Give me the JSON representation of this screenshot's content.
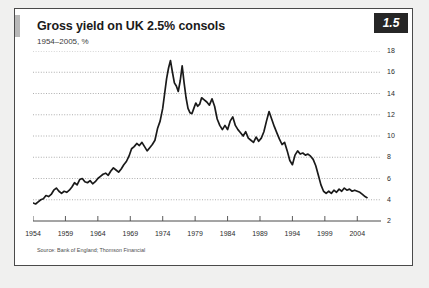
{
  "figure": {
    "badge": "1.5",
    "title": "Gross yield on UK 2.5% consols",
    "subtitle": "1954–2005, %",
    "source": "Source: Bank of England; Thomson Financial"
  },
  "colors": {
    "line": "#1a1a1a",
    "grid": "#9a9a9a",
    "axis": "#4a4a4a",
    "panel_bg": "#ffffff",
    "page_bg": "#f0f0ef",
    "badge_bg": "#262626"
  },
  "chart_data": {
    "type": "line",
    "title": "Gross yield on UK 2.5% consols",
    "subtitle": "1954–2005, %",
    "xlabel": "",
    "ylabel": "%",
    "xlim": [
      1954,
      2005.5
    ],
    "ylim": [
      2,
      18
    ],
    "ytick_step": 2,
    "yticks": [
      2,
      4,
      6,
      8,
      10,
      12,
      14,
      16,
      18
    ],
    "ytick_labels": [
      "2",
      "4",
      "6",
      "8",
      "10",
      "12",
      "14",
      "16",
      "18"
    ],
    "xticks": [
      1954,
      1959,
      1964,
      1969,
      1974,
      1979,
      1984,
      1989,
      1994,
      1999,
      2004
    ],
    "xtick_labels": [
      "1954",
      "1959",
      "1964",
      "1969",
      "1974",
      "1979",
      "1984",
      "1989",
      "1994",
      "1999",
      "2004"
    ],
    "grid": "horizontal-dotted",
    "legend": "none",
    "axis_position": {
      "y": "right",
      "x": "bottom"
    },
    "series": [
      {
        "name": "Gross yield on UK 2.5% consols",
        "x": [
          1954.0,
          1954.4,
          1954.8,
          1955.2,
          1955.6,
          1956.0,
          1956.4,
          1956.8,
          1957.2,
          1957.6,
          1958.0,
          1958.4,
          1958.8,
          1959.2,
          1959.6,
          1960.0,
          1960.4,
          1960.8,
          1961.2,
          1961.6,
          1962.0,
          1962.4,
          1962.8,
          1963.2,
          1963.6,
          1964.0,
          1964.4,
          1964.8,
          1965.2,
          1965.6,
          1966.0,
          1966.4,
          1966.8,
          1967.2,
          1967.6,
          1968.0,
          1968.4,
          1968.8,
          1969.2,
          1969.6,
          1970.0,
          1970.4,
          1970.8,
          1971.2,
          1971.6,
          1972.0,
          1972.4,
          1972.8,
          1973.2,
          1973.6,
          1974.0,
          1974.3,
          1974.6,
          1974.9,
          1975.2,
          1975.5,
          1975.8,
          1976.1,
          1976.4,
          1976.7,
          1977.0,
          1977.3,
          1977.6,
          1977.9,
          1978.2,
          1978.5,
          1978.8,
          1979.1,
          1979.4,
          1979.7,
          1980.0,
          1980.4,
          1980.8,
          1981.2,
          1981.6,
          1982.0,
          1982.4,
          1982.8,
          1983.2,
          1983.6,
          1984.0,
          1984.4,
          1984.8,
          1985.2,
          1985.6,
          1986.0,
          1986.4,
          1986.8,
          1987.2,
          1987.6,
          1988.0,
          1988.4,
          1988.8,
          1989.2,
          1989.6,
          1990.0,
          1990.4,
          1990.8,
          1991.2,
          1991.6,
          1992.0,
          1992.4,
          1992.8,
          1993.2,
          1993.6,
          1994.0,
          1994.4,
          1994.8,
          1995.2,
          1995.6,
          1996.0,
          1996.4,
          1996.8,
          1997.2,
          1997.6,
          1998.0,
          1998.4,
          1998.8,
          1999.2,
          1999.6,
          2000.0,
          2000.4,
          2000.8,
          2001.2,
          2001.6,
          2002.0,
          2002.4,
          2002.8,
          2003.2,
          2003.6,
          2004.0,
          2004.4,
          2004.8,
          2005.2,
          2005.5
        ],
        "y": [
          3.7,
          3.6,
          3.8,
          4.0,
          4.1,
          4.4,
          4.3,
          4.5,
          4.9,
          5.1,
          4.8,
          4.6,
          4.8,
          4.7,
          4.9,
          5.2,
          5.6,
          5.4,
          5.9,
          6.0,
          5.7,
          5.6,
          5.8,
          5.5,
          5.7,
          6.0,
          6.2,
          6.4,
          6.5,
          6.3,
          6.7,
          7.0,
          6.8,
          6.6,
          6.9,
          7.3,
          7.6,
          8.1,
          8.8,
          9.0,
          9.3,
          9.1,
          9.4,
          9.0,
          8.6,
          8.9,
          9.2,
          9.6,
          10.7,
          11.4,
          12.6,
          14.0,
          15.4,
          16.4,
          17.1,
          16.0,
          15.0,
          14.7,
          14.2,
          15.2,
          16.6,
          15.0,
          13.6,
          12.6,
          12.2,
          12.1,
          12.6,
          13.1,
          12.8,
          13.0,
          13.6,
          13.4,
          13.2,
          12.9,
          13.5,
          12.8,
          11.6,
          11.0,
          10.6,
          11.0,
          10.6,
          11.4,
          11.8,
          11.0,
          10.6,
          10.3,
          10.0,
          10.4,
          9.8,
          9.6,
          9.4,
          9.9,
          9.5,
          9.8,
          10.4,
          11.4,
          12.3,
          11.6,
          10.9,
          10.3,
          9.7,
          9.2,
          9.4,
          8.6,
          7.7,
          7.3,
          8.2,
          8.6,
          8.3,
          8.4,
          8.2,
          8.3,
          8.1,
          7.8,
          7.2,
          6.3,
          5.4,
          4.8,
          4.6,
          4.8,
          4.6,
          4.9,
          4.7,
          5.0,
          4.8,
          5.1,
          4.9,
          5.0,
          4.8,
          4.9,
          4.8,
          4.7,
          4.5,
          4.3,
          4.2
        ]
      }
    ],
    "annotations": {
      "peak": {
        "year": 1975.2,
        "value": 17.1
      },
      "start": {
        "year": 1954,
        "value": 3.7
      },
      "end": {
        "year": 2005.5,
        "value": 4.2
      }
    }
  }
}
